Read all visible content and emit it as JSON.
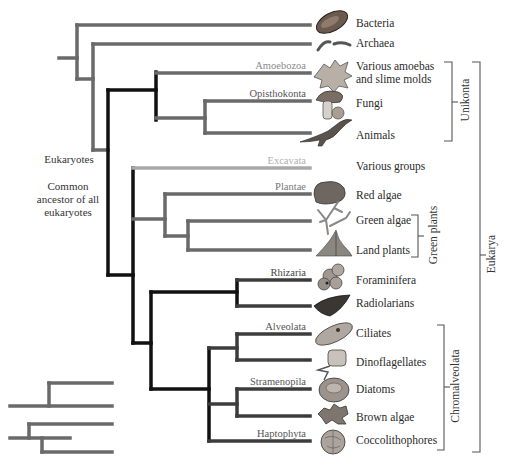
{
  "colors": {
    "dark_lineage": "#111111",
    "medium_lineage": "#666666",
    "light_lineage": "#a8a8a8",
    "text": "#2a2a2a",
    "group_label_gray": "#8a8a8a"
  },
  "left_labels": {
    "eukaryotes": "Eukaryotes",
    "common_ancestor": "Common ancestor of all eukaryotes"
  },
  "taxa": [
    {
      "label": "Bacteria",
      "icon": "bacterium-icon"
    },
    {
      "label": "Archaea",
      "icon": "archaea-icon"
    },
    {
      "label": "Various amoebas and slime molds",
      "icon": "amoeba-icon"
    },
    {
      "label": "Fungi",
      "icon": "mushroom-icon"
    },
    {
      "label": "Animals",
      "icon": "dinosaur-icon"
    },
    {
      "label": "Various groups",
      "icon": ""
    },
    {
      "label": "Red algae",
      "icon": "red-alga-icon"
    },
    {
      "label": "Green algae",
      "icon": "green-alga-icon"
    },
    {
      "label": "Land plants",
      "icon": "fern-icon"
    },
    {
      "label": "Foraminifera",
      "icon": "foram-icon"
    },
    {
      "label": "Radiolarians",
      "icon": "radiolarian-icon"
    },
    {
      "label": "Ciliates",
      "icon": "ciliate-icon"
    },
    {
      "label": "Dinoflagellates",
      "icon": "dinoflagellate-icon"
    },
    {
      "label": "Diatoms",
      "icon": "diatom-icon"
    },
    {
      "label": "Brown algae",
      "icon": "brown-alga-icon"
    },
    {
      "label": "Coccolithophores",
      "icon": "coccolithophore-icon"
    }
  ],
  "clade_labels": {
    "amoebozoa": "Amoebozoa",
    "opisthokonta": "Opisthokonta",
    "excavata": "Excavata",
    "plantae": "Plantae",
    "rhizaria": "Rhizaria",
    "alveolata": "Alveolata",
    "stramenopila": "Stramenopila",
    "haptophyta": "Haptophyta"
  },
  "brackets": {
    "unikonta": "Unikonta",
    "green_plants": "Green plants",
    "chromalveolata": "Chromalveolata",
    "eukarya": "Eukarya"
  }
}
